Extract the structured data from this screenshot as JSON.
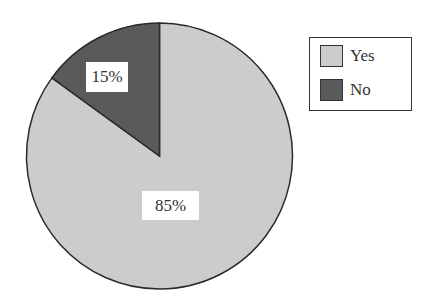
{
  "chart_data": {
    "type": "pie",
    "title": "",
    "categories": [
      "Yes",
      "No"
    ],
    "values": [
      85,
      15
    ],
    "labels": [
      "85%",
      "15%"
    ],
    "colors": [
      "#cccccc",
      "#5a5a5a"
    ],
    "legend": {
      "position": "right",
      "entries": [
        "Yes",
        "No"
      ]
    },
    "start_angle_deg": 0,
    "direction": "clockwise"
  }
}
